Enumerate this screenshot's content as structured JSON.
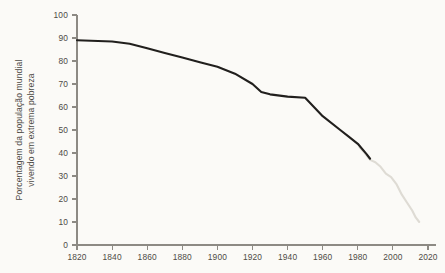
{
  "chart_data": {
    "type": "line",
    "title": "",
    "subtitle": "",
    "xlabel": "",
    "ylabel": "Porcentagem da população mundial vivendo em extrema pobreza",
    "ylabel_line1": "Porcentagem da população mundial",
    "ylabel_line2": "vivendo em extrema pobreza",
    "xlim": [
      1820,
      2020
    ],
    "ylim": [
      0,
      100
    ],
    "grid": false,
    "legend": "none",
    "x_ticks": [
      1820,
      1840,
      1860,
      1880,
      1900,
      1920,
      1940,
      1960,
      1980,
      2000,
      2020
    ],
    "y_ticks": [
      0,
      10,
      20,
      30,
      40,
      50,
      60,
      70,
      80,
      90,
      100
    ],
    "x_tick_labels": [
      "1820",
      "1840",
      "1860",
      "1880",
      "1900",
      "1920",
      "1940",
      "1960",
      "1980",
      "2000",
      "2020"
    ],
    "y_tick_labels": [
      "0",
      "10",
      "20",
      "30",
      "40",
      "50",
      "60",
      "70",
      "80",
      "90",
      "100"
    ],
    "colors": {
      "historical_line": "#211f1d",
      "recent_line": "#dedbd4",
      "axis": "#8d8a84",
      "text": "#4e4b46",
      "background": "#fbfaf7"
    },
    "series": [
      {
        "name": "Estimativa histórica",
        "color": "#211f1d",
        "x": [
          1820,
          1840,
          1850,
          1860,
          1870,
          1880,
          1890,
          1900,
          1910,
          1920,
          1925,
          1930,
          1940,
          1950,
          1955,
          1960,
          1970,
          1975,
          1980,
          1985,
          1987
        ],
        "values": [
          89.0,
          88.5,
          87.5,
          85.5,
          83.5,
          81.5,
          79.5,
          77.5,
          74.5,
          70.0,
          66.5,
          65.5,
          64.5,
          64.0,
          60.0,
          56.0,
          50.0,
          47.0,
          44.0,
          39.5,
          37.5
        ]
      },
      {
        "name": "Série recente",
        "color": "#dedbd4",
        "x": [
          1981,
          1984,
          1987,
          1990,
          1993,
          1996,
          1999,
          2002,
          2005,
          2008,
          2011,
          2013,
          2015
        ],
        "values": [
          42.5,
          40.0,
          37.0,
          36.0,
          34.0,
          31.0,
          29.5,
          26.5,
          22.0,
          18.5,
          15.0,
          12.0,
          10.0
        ]
      }
    ]
  }
}
